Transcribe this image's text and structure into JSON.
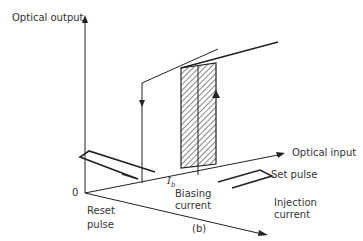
{
  "diagram": {
    "axes": {
      "y_label": "Optical output",
      "x_label": "Optical input",
      "z_label_line1": "Injection",
      "z_label_line2": "current",
      "origin_label": "0"
    },
    "annotations": {
      "ib_symbol": "I",
      "ib_subscript": "b",
      "biasing_line1": "Biasing",
      "biasing_line2": "current",
      "reset_line1": "Reset",
      "reset_line2": "pulse",
      "set_pulse": "Set pulse",
      "caption": "(b)"
    },
    "colors": {
      "line": "#222222",
      "text": "#333333",
      "background": "#ffffff"
    }
  }
}
